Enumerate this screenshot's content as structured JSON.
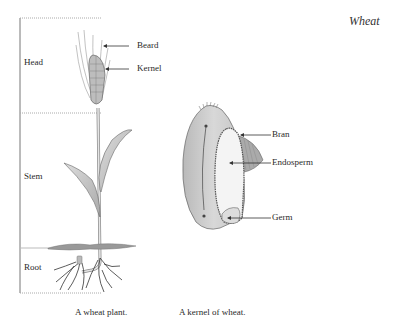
{
  "title": "Wheat",
  "plant": {
    "regions": [
      {
        "label": "Head"
      },
      {
        "label": "Stem"
      },
      {
        "label": "Root"
      }
    ],
    "parts": [
      {
        "label": "Beard"
      },
      {
        "label": "Kernel"
      }
    ],
    "caption": "A wheat plant."
  },
  "kernel": {
    "parts": [
      {
        "label": "Bran"
      },
      {
        "label": "Endosperm"
      },
      {
        "label": "Germ"
      }
    ],
    "caption": "A kernel of wheat."
  }
}
